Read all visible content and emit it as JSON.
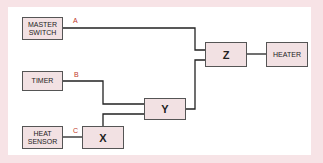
{
  "diagram": {
    "inputs": [
      {
        "id": "master_switch",
        "label": "MASTER SWITCH",
        "line_label": "A"
      },
      {
        "id": "timer",
        "label": "TIMER",
        "line_label": "B"
      },
      {
        "id": "heat_sensor",
        "label": "HEAT SENSOR",
        "line_label": "C"
      }
    ],
    "gates": [
      {
        "id": "x",
        "label": "X"
      },
      {
        "id": "y",
        "label": "Y"
      },
      {
        "id": "z",
        "label": "Z"
      }
    ],
    "output": {
      "id": "heater",
      "label": "HEATER"
    },
    "connections": [
      [
        "heat_sensor",
        "x"
      ],
      [
        "timer",
        "y"
      ],
      [
        "x",
        "y"
      ],
      [
        "master_switch",
        "z"
      ],
      [
        "y",
        "z"
      ],
      [
        "z",
        "heater"
      ]
    ],
    "colors": {
      "border": "#f7e3e6",
      "box_fill": "#f2e1e3",
      "line": "#222222",
      "line_label": "#c0392b"
    }
  }
}
